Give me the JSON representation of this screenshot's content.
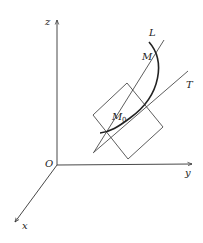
{
  "diagram": {
    "axes": {
      "x_label": "x",
      "y_label": "y",
      "z_label": "z",
      "origin_label": "O"
    },
    "curve_label": "L",
    "point_labels": {
      "m": "M",
      "m0": "M",
      "m0_sub": "0"
    },
    "tangent_label": "T",
    "colors": {
      "stroke": "#333333",
      "curve": "#222222",
      "background": "#ffffff"
    }
  }
}
